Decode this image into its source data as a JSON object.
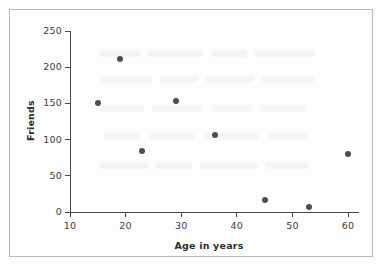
{
  "chart_data": {
    "type": "scatter",
    "title": "",
    "xlabel": "Age in years",
    "ylabel": "Friends",
    "xlim": [
      10,
      62
    ],
    "ylim": [
      0,
      250
    ],
    "xticks": [
      10,
      20,
      30,
      40,
      50,
      60
    ],
    "yticks": [
      0,
      50,
      100,
      150,
      200,
      250
    ],
    "xtick_labels": [
      "10",
      "20",
      "30",
      "40",
      "50",
      "60"
    ],
    "ytick_labels": [
      "0",
      "50",
      "100",
      "150",
      "200",
      "250"
    ],
    "grid": false,
    "legend": false,
    "marker_color": "#4d4d4d",
    "axis_color": "#4a4a4a",
    "points": [
      {
        "x": 15,
        "y": 151
      },
      {
        "x": 19,
        "y": 211
      },
      {
        "x": 23,
        "y": 84
      },
      {
        "x": 29,
        "y": 154
      },
      {
        "x": 36,
        "y": 107
      },
      {
        "x": 45,
        "y": 16
      },
      {
        "x": 53,
        "y": 7
      },
      {
        "x": 60,
        "y": 80
      }
    ]
  },
  "figure": {
    "border_color": "#b9b9b9",
    "background_color": "#fdfdfd"
  }
}
